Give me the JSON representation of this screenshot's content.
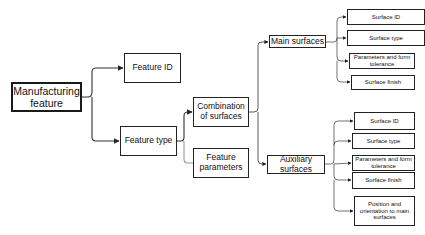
{
  "diagram": {
    "root": {
      "label": "Manufacturing feature"
    },
    "level1": [
      {
        "label": "Feature ID"
      },
      {
        "label": "Feature type"
      }
    ],
    "level2": [
      {
        "label": "Combination of surfaces"
      },
      {
        "label": "Feature parameters"
      }
    ],
    "level3": [
      {
        "label": "Main surfaces"
      },
      {
        "label": "Auxiliary surfaces"
      }
    ],
    "main_surfaces_children": [
      {
        "label": "Surface ID"
      },
      {
        "label": "Surface type"
      },
      {
        "label": "Parameters and form tolerance"
      },
      {
        "label": "Surface finish"
      }
    ],
    "auxiliary_surfaces_children": [
      {
        "label": "Surface ID"
      },
      {
        "label": "Surface type"
      },
      {
        "label": "Parameters and form tolerance"
      },
      {
        "label": "Surface finish"
      },
      {
        "label": "Position and orientation to main surfaces"
      }
    ],
    "colors": {
      "line": "#333333",
      "border": "#222222",
      "background": "#ffffff"
    }
  }
}
